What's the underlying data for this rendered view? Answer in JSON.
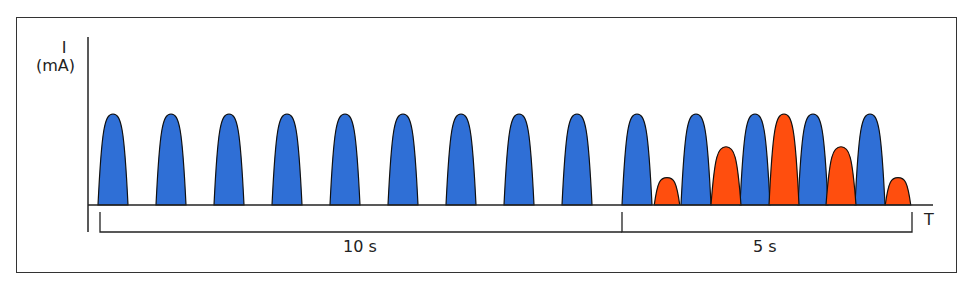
{
  "chart_data": {
    "type": "diagram",
    "title": "",
    "ylabel_line1": "I",
    "ylabel_line2": "(mA)",
    "xlabel": "T",
    "colors": {
      "blue": "#2f6fd6",
      "orange": "#ff4e0e",
      "outline": "#111111"
    },
    "baseline_y": 205,
    "full_height": 91,
    "half_width": 15,
    "blue_pulses": [
      {
        "x": 113,
        "amp": 1.0
      },
      {
        "x": 171,
        "amp": 1.0
      },
      {
        "x": 229,
        "amp": 1.0
      },
      {
        "x": 287,
        "amp": 1.0
      },
      {
        "x": 345,
        "amp": 1.0
      },
      {
        "x": 403,
        "amp": 1.0
      },
      {
        "x": 461,
        "amp": 1.0
      },
      {
        "x": 519,
        "amp": 1.0
      },
      {
        "x": 577,
        "amp": 1.0
      },
      {
        "x": 637,
        "amp": 1.0
      },
      {
        "x": 696,
        "amp": 1.0
      },
      {
        "x": 755,
        "amp": 1.0
      },
      {
        "x": 813,
        "amp": 1.0
      },
      {
        "x": 870,
        "amp": 1.0
      }
    ],
    "orange_pulses": [
      {
        "x": 667,
        "amp": 0.3
      },
      {
        "x": 726,
        "amp": 0.64
      },
      {
        "x": 784,
        "amp": 1.0
      },
      {
        "x": 841,
        "amp": 0.64
      },
      {
        "x": 898,
        "amp": 0.3
      }
    ],
    "intervals": [
      {
        "label": "10 s",
        "x0": 100,
        "x1": 622
      },
      {
        "label": "5 s",
        "x0": 622,
        "x1": 912
      }
    ]
  }
}
